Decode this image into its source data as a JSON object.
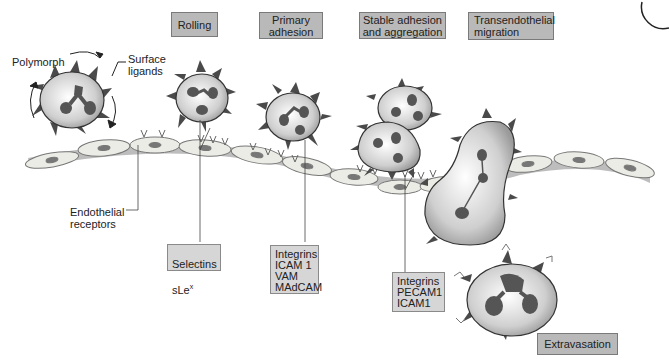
{
  "stages": [
    {
      "id": "rolling",
      "label": "Rolling"
    },
    {
      "id": "primary-adhesion",
      "label": "Primary\nadhesion"
    },
    {
      "id": "stable-adhesion",
      "label": "Stable adhesion\nand aggregation"
    },
    {
      "id": "transendothelial",
      "label": "Transendothelial\nmigration"
    },
    {
      "id": "extravasation",
      "label": "Extravasation"
    }
  ],
  "labels": {
    "polymorph": "Polymorph",
    "surface_ligands": "Surface\nligands",
    "endothelial_receptors": "Endothelial\nreceptors"
  },
  "molecules": {
    "rolling": {
      "line1": "Selectins",
      "line2_base": "sLe",
      "line2_sup": "x"
    },
    "primary": "Integrins\nICAM 1\nVAM\nMAdCAM",
    "stable": "Integrins\nPECAM1\nICAM1"
  },
  "colors": {
    "stage_box": "#b9b9b9",
    "molecule_box": "#d6d6d6",
    "cell_fill": "#d0d0d0",
    "nucleus": "#555555",
    "ligand": "#4a4a4a",
    "endothelium": "#e8e8e2",
    "basement": "#bdbdbd"
  }
}
